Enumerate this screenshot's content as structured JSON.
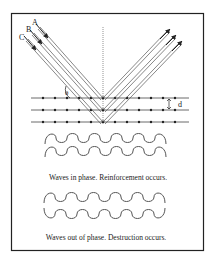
{
  "diagram": {
    "beam_labels": [
      "A",
      "B",
      "C"
    ],
    "angle_label": "θ",
    "spacing_label": "d",
    "captions": {
      "in_phase": "Waves in phase. Reinforcement occurs.",
      "out_of_phase": "Waves out of phase. Destruction occurs."
    },
    "colors": {
      "frame": "#222222",
      "lines": "#555555",
      "text": "#222222"
    }
  }
}
